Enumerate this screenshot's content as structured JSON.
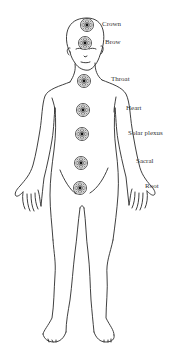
{
  "diagram": {
    "line_color": "#2a2a2a",
    "background": "#ffffff",
    "chakras": [
      {
        "name": "Crown",
        "cx": 87,
        "cy": 25,
        "label_x": 102,
        "label_y": 21
      },
      {
        "name": "Brow",
        "cx": 85,
        "cy": 43,
        "label_x": 105,
        "label_y": 39
      },
      {
        "name": "Throat",
        "cx": 84,
        "cy": 81,
        "label_x": 111,
        "label_y": 76
      },
      {
        "name": "Heart",
        "cx": 83,
        "cy": 110,
        "label_x": 126,
        "label_y": 105
      },
      {
        "name": "Solar plexus",
        "cx": 82,
        "cy": 134,
        "label_x": 128,
        "label_y": 130
      },
      {
        "name": "Sacral",
        "cx": 81,
        "cy": 163,
        "label_x": 136,
        "label_y": 158
      },
      {
        "name": "Root",
        "cx": 80,
        "cy": 188,
        "label_x": 145,
        "label_y": 183
      }
    ]
  }
}
